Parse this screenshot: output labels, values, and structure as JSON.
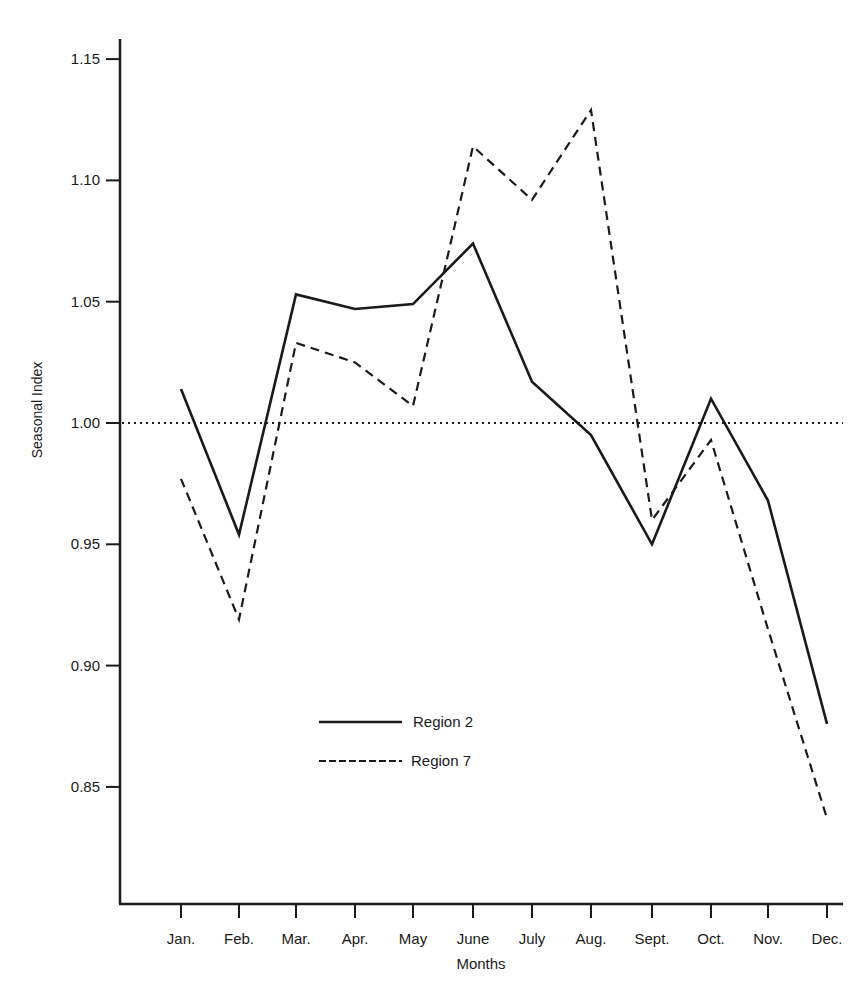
{
  "chart_data": {
    "type": "line",
    "title": "",
    "xlabel": "Months",
    "ylabel": "Seasonal Index",
    "categories": [
      "Jan.",
      "Feb.",
      "Mar.",
      "Apr.",
      "May",
      "June",
      "July",
      "Aug.",
      "Sept.",
      "Oct.",
      "Nov.",
      "Dec."
    ],
    "series": [
      {
        "name": "Region 2",
        "style": "solid",
        "values": [
          1.014,
          0.954,
          1.053,
          1.047,
          1.049,
          1.074,
          1.017,
          0.995,
          0.95,
          1.01,
          0.968,
          0.876
        ]
      },
      {
        "name": "Region 7",
        "style": "dashed",
        "values": [
          0.977,
          0.919,
          1.033,
          1.025,
          1.007,
          1.114,
          1.092,
          1.129,
          0.96,
          0.993,
          0.915,
          0.837
        ]
      }
    ],
    "reference_line": {
      "value": 1.0,
      "style": "dotted"
    },
    "yticks": [
      0.85,
      0.9,
      0.95,
      1.0,
      1.05,
      1.1,
      1.15
    ],
    "ytick_labels": [
      "0.85",
      "0.90",
      "0.95",
      "1.00",
      "1.05",
      "1.10",
      "1.15"
    ],
    "ylim": [
      0.8,
      1.165
    ],
    "grid": false,
    "legend_position": "inside lower-center"
  },
  "legend": {
    "items": [
      {
        "label": "Region 2",
        "style": "solid"
      },
      {
        "label": "Region 7",
        "style": "dashed"
      }
    ]
  },
  "colors": {
    "ink": "#1a1a1a",
    "background": "#ffffff"
  }
}
